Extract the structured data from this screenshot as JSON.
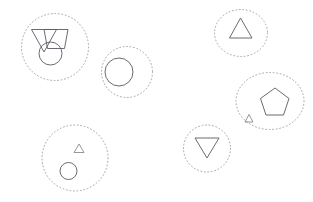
{
  "canvas": {
    "width": 313,
    "height": 202,
    "background_color": "#ffffff",
    "description": "Six dotted circular cluster boundaries each containing outlined geometric shapes"
  },
  "style": {
    "boundary_color": "#9a9a9a",
    "boundary_stroke_width": 0.9,
    "boundary_dash": "0.9 2.6",
    "shape_color": "#5a5a64",
    "shape_stroke_width": 0.9,
    "small_shape_color": "#6b6b75",
    "small_shape_stroke_width": 0.7
  },
  "clusters": [
    {
      "id": "cluster-1",
      "name": "top-left-cluster",
      "boundary": {
        "cx": 55,
        "cy": 47,
        "rx": 33.5,
        "ry": 33.5
      },
      "shapes": [
        {
          "id": "shape-1-triangle",
          "name": "triangle-up",
          "kind": "triangle-up",
          "points": "31.5,29.5 56.5,29.5 44,52"
        },
        {
          "id": "shape-2-trapezoid",
          "name": "trapezoid",
          "kind": "trapezoid",
          "points": "44,29.5 68,29.5 64.5,48.5 47.5,48.5"
        },
        {
          "id": "shape-3-circle",
          "name": "circle",
          "kind": "circle",
          "cx": 50.5,
          "cy": 53.5,
          "r": 11.5
        }
      ]
    },
    {
      "id": "cluster-2",
      "name": "upper-middle-cluster",
      "boundary": {
        "cx": 127,
        "cy": 72,
        "rx": 25.5,
        "ry": 25.5
      },
      "shapes": [
        {
          "id": "shape-4-circle",
          "name": "circle",
          "kind": "circle",
          "cx": 119,
          "cy": 72,
          "r": 14
        }
      ]
    },
    {
      "id": "cluster-3",
      "name": "top-right-cluster",
      "boundary": {
        "cx": 241,
        "cy": 33,
        "rx": 26.5,
        "ry": 23.5
      },
      "shapes": [
        {
          "id": "shape-5-triangle",
          "name": "triangle-up",
          "kind": "triangle-up",
          "points": "229.5,38 252,38 240.5,18"
        }
      ]
    },
    {
      "id": "cluster-4",
      "name": "right-pentagon-cluster",
      "boundary": {
        "cx": 270,
        "cy": 101,
        "rx": 34,
        "ry": 28.5
      },
      "shapes": [
        {
          "id": "shape-6-pentagon",
          "name": "pentagon",
          "kind": "pentagon",
          "points": "275,88 289,98.5 283.5,115 266,115 260.5,98.5"
        },
        {
          "id": "shape-7-small-triangle",
          "name": "small-triangle-up",
          "kind": "triangle-up",
          "points": "245,122 253,122 249,114.5",
          "small": true
        }
      ]
    },
    {
      "id": "cluster-5",
      "name": "bottom-middle-cluster",
      "boundary": {
        "cx": 207,
        "cy": 148.5,
        "rx": 23.5,
        "ry": 23.5
      },
      "shapes": [
        {
          "id": "shape-8-triangle-down",
          "name": "triangle-down",
          "kind": "triangle-down",
          "points": "195,138 219,138 207,158"
        }
      ]
    },
    {
      "id": "cluster-6",
      "name": "bottom-left-cluster",
      "boundary": {
        "cx": 75,
        "cy": 158,
        "rx": 33,
        "ry": 33
      },
      "shapes": [
        {
          "id": "shape-9-small-triangle",
          "name": "small-triangle-up",
          "kind": "triangle-up",
          "points": "74,152.5 84,152.5 79,144",
          "small": true
        },
        {
          "id": "shape-10-circle",
          "name": "circle",
          "kind": "circle",
          "cx": 68.5,
          "cy": 171,
          "r": 8.5
        }
      ]
    }
  ]
}
